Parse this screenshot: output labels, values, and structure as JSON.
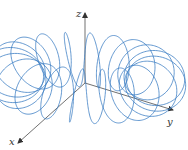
{
  "figure": {
    "curve_color": "#3d7fc4",
    "axis_color": "#333333"
  },
  "axes": {
    "x": {
      "label": "x"
    },
    "y": {
      "label": "y"
    },
    "z": {
      "label": "z"
    }
  },
  "curve": {
    "type": "toroidal-spiral",
    "major_radius": 1.0,
    "minor_radius": 0.42,
    "windings": 20,
    "samples": 2400
  }
}
